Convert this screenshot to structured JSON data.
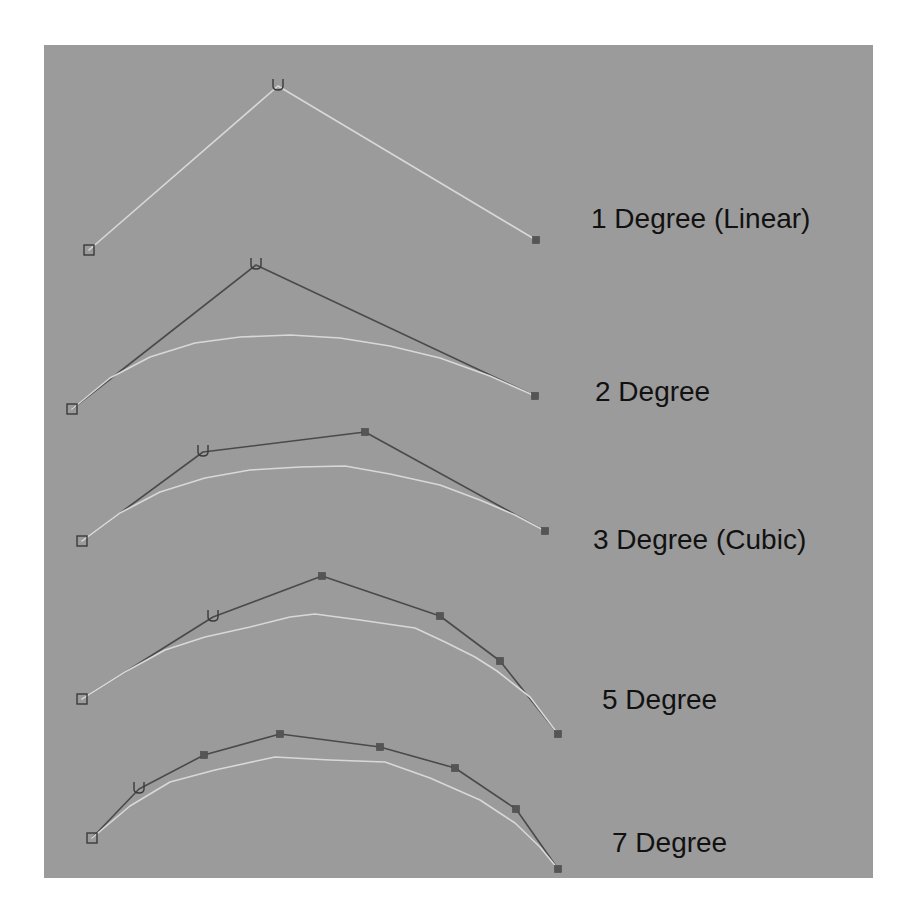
{
  "figure": {
    "width": 916,
    "height": 921,
    "background": "#ffffff",
    "panel": {
      "x": 44,
      "y": 45,
      "width": 829,
      "height": 833,
      "color": "#9b9b9b"
    }
  },
  "colors": {
    "hull": "#4a4a4a",
    "curve": "#d8d8d8",
    "marker": "#3a3a3a",
    "label": "#111111"
  },
  "icons": {
    "start_cv": "open-square-icon",
    "direction_cv": "u-direction-icon",
    "control_vertex": "filled-square-icon"
  },
  "curves": [
    {
      "label": "1 Degree (Linear)",
      "label_pos": [
        591,
        228
      ],
      "show_hull": false,
      "control_points": [
        [
          89,
          250
        ],
        [
          278,
          86
        ],
        [
          536,
          240
        ]
      ],
      "curve_points": [
        [
          89,
          250
        ],
        [
          278,
          86
        ],
        [
          536,
          240
        ]
      ]
    },
    {
      "label": "2 Degree",
      "label_pos": [
        595,
        401
      ],
      "show_hull": true,
      "control_points": [
        [
          72,
          409
        ],
        [
          256,
          265
        ],
        [
          535,
          396
        ]
      ],
      "curve_points": [
        [
          72,
          409
        ],
        [
          110,
          378
        ],
        [
          150,
          357
        ],
        [
          195,
          343
        ],
        [
          240,
          337
        ],
        [
          290,
          335
        ],
        [
          340,
          338
        ],
        [
          390,
          346
        ],
        [
          440,
          358
        ],
        [
          490,
          376
        ],
        [
          535,
          396
        ]
      ]
    },
    {
      "label": "3 Degree (Cubic)",
      "label_pos": [
        593,
        549
      ],
      "show_hull": true,
      "control_points": [
        [
          82,
          541
        ],
        [
          203,
          452
        ],
        [
          365,
          432
        ],
        [
          545,
          531
        ]
      ],
      "curve_points": [
        [
          82,
          541
        ],
        [
          120,
          513
        ],
        [
          160,
          492
        ],
        [
          205,
          478
        ],
        [
          250,
          470
        ],
        [
          300,
          467
        ],
        [
          345,
          466
        ],
        [
          390,
          474
        ],
        [
          440,
          485
        ],
        [
          480,
          500
        ],
        [
          515,
          515
        ],
        [
          545,
          531
        ]
      ]
    },
    {
      "label": "5 Degree",
      "label_pos": [
        602,
        709
      ],
      "show_hull": true,
      "control_points": [
        [
          82,
          699
        ],
        [
          213,
          617
        ],
        [
          322,
          576
        ],
        [
          440,
          616
        ],
        [
          500,
          661
        ],
        [
          558,
          734
        ]
      ],
      "curve_points": [
        [
          82,
          699
        ],
        [
          125,
          672
        ],
        [
          165,
          650
        ],
        [
          205,
          637
        ],
        [
          250,
          627
        ],
        [
          290,
          617
        ],
        [
          315,
          614
        ],
        [
          360,
          620
        ],
        [
          415,
          628
        ],
        [
          445,
          642
        ],
        [
          475,
          657
        ],
        [
          497,
          671
        ],
        [
          530,
          697
        ],
        [
          558,
          734
        ]
      ]
    },
    {
      "label": "7 Degree",
      "label_pos": [
        612,
        852
      ],
      "show_hull": true,
      "control_points": [
        [
          92,
          838
        ],
        [
          139,
          789
        ],
        [
          204,
          755
        ],
        [
          280,
          734
        ],
        [
          380,
          747
        ],
        [
          455,
          768
        ],
        [
          516,
          809
        ],
        [
          558,
          869
        ]
      ],
      "curve_points": [
        [
          92,
          838
        ],
        [
          130,
          806
        ],
        [
          170,
          782
        ],
        [
          215,
          770
        ],
        [
          275,
          757
        ],
        [
          330,
          760
        ],
        [
          385,
          762
        ],
        [
          430,
          778
        ],
        [
          480,
          800
        ],
        [
          515,
          823
        ],
        [
          540,
          847
        ],
        [
          558,
          869
        ]
      ]
    }
  ]
}
